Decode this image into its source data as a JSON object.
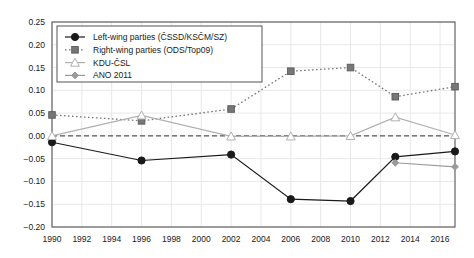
{
  "chart_data": {
    "type": "line",
    "title": "",
    "xlabel": "",
    "ylabel": "",
    "xlim": [
      1990,
      2017
    ],
    "ylim": [
      -0.2,
      0.25
    ],
    "grid": true,
    "legend_position": "top-left",
    "xticks": [
      1990,
      1992,
      1994,
      1996,
      1998,
      2000,
      2002,
      2004,
      2006,
      2008,
      2010,
      2012,
      2014,
      2016
    ],
    "xtick_labels": [
      "1990",
      "1992",
      "1994",
      "1996",
      "1998",
      "2000",
      "2002",
      "2004",
      "2006",
      "2008",
      "2010",
      "2012",
      "2014",
      "2016"
    ],
    "yticks": [
      0.25,
      0.2,
      0.15,
      0.1,
      0.05,
      0.0,
      -0.05,
      -0.1,
      -0.15,
      -0.2
    ],
    "ytick_labels": [
      "0.25",
      "0.20",
      "0.15",
      "0.10",
      "0.05",
      "0.00",
      "−0.05",
      "−0.10",
      "−0.15",
      "−0.20"
    ],
    "zero_line": 0.0,
    "series": [
      {
        "name": "Left-wing parties (ČSSD/KSČM/SZ)",
        "marker": "filled-circle",
        "linestyle": "solid",
        "color": "#1a1a1a",
        "x": [
          1990,
          1996,
          2002,
          2006,
          2010,
          2013,
          2017
        ],
        "values": [
          -0.014,
          -0.054,
          -0.041,
          -0.139,
          -0.143,
          -0.046,
          -0.034
        ]
      },
      {
        "name": "Right-wing parties (ODS/Top09)",
        "marker": "filled-square",
        "linestyle": "dotted",
        "color": "#777777",
        "x": [
          1990,
          1996,
          2002,
          2006,
          2010,
          2013,
          2017
        ],
        "values": [
          0.046,
          0.033,
          0.059,
          0.142,
          0.15,
          0.086,
          0.108
        ]
      },
      {
        "name": "KDU-ČSL",
        "marker": "open-triangle",
        "linestyle": "solid",
        "color": "#b0b0b0",
        "x": [
          1990,
          1996,
          2002,
          2006,
          2010,
          2013,
          2017
        ],
        "values": [
          0.0,
          0.045,
          -0.001,
          -0.001,
          0.0,
          0.041,
          0.002
        ]
      },
      {
        "name": "ANO 2011",
        "marker": "filled-diamond",
        "linestyle": "solid",
        "color": "#9a9a9a",
        "x": [
          2013,
          2017
        ],
        "values": [
          -0.059,
          -0.068
        ]
      }
    ]
  },
  "legend": {
    "entries": [
      {
        "label": "Left-wing parties (ČSSD/KSČM/SZ)"
      },
      {
        "label": "Right-wing parties (ODS/Top09)"
      },
      {
        "label": "KDU-ČSL"
      },
      {
        "label": "ANO 2011"
      }
    ]
  },
  "colors": {
    "left_wing": "#1a1a1a",
    "right_wing": "#777777",
    "kdu": "#b0b0b0",
    "ano": "#9a9a9a",
    "axis": "#555555",
    "grid": "#e8e8e8",
    "background": "#ffffff"
  }
}
